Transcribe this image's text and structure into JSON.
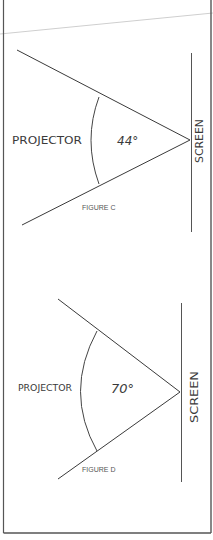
{
  "colors": {
    "ink": "#3a3a3a",
    "border": "#555555",
    "fold_line": "#cfcfcf",
    "paper": "#ffffff"
  },
  "figures": [
    {
      "id": "figure-c",
      "caption": "FIGURE C",
      "projector_label": "PROJECTOR",
      "screen_label": "SCREEN",
      "angle_label": "44°",
      "angle_degrees": 44
    },
    {
      "id": "figure-d",
      "caption": "FIGURE D",
      "projector_label": "PROJECTOR",
      "screen_label": "SCREEN",
      "angle_label": "70°",
      "angle_degrees": 70
    }
  ]
}
